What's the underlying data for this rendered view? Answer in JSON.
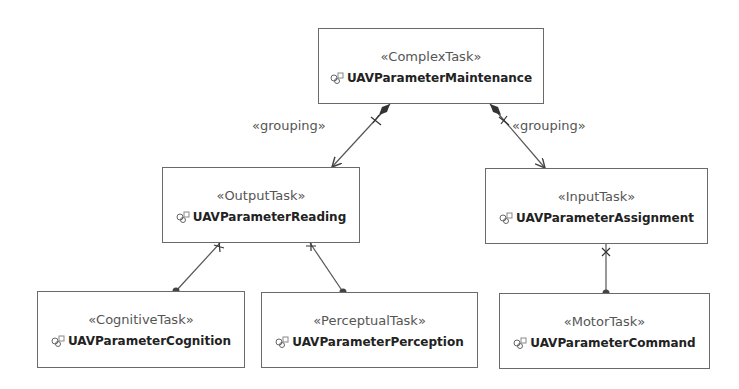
{
  "diagram": {
    "nodes": [
      {
        "id": "maintenance",
        "stereotype": "«ComplexTask»",
        "name": "UAVParameterMaintenance"
      },
      {
        "id": "reading",
        "stereotype": "«OutputTask»",
        "name": "UAVParameterReading"
      },
      {
        "id": "assignment",
        "stereotype": "«InputTask»",
        "name": "UAVParameterAssignment"
      },
      {
        "id": "cognition",
        "stereotype": "«CognitiveTask»",
        "name": "UAVParameterCognition"
      },
      {
        "id": "perception",
        "stereotype": "«PerceptualTask»",
        "name": "UAVParameterPerception"
      },
      {
        "id": "command",
        "stereotype": "«MotorTask»",
        "name": "UAVParameterCommand"
      }
    ],
    "edges": [
      {
        "from": "maintenance",
        "to": "reading",
        "label": "«grouping»"
      },
      {
        "from": "maintenance",
        "to": "assignment",
        "label": "«grouping»"
      },
      {
        "from": "reading",
        "to": "cognition",
        "label": ""
      },
      {
        "from": "reading",
        "to": "perception",
        "label": ""
      },
      {
        "from": "assignment",
        "to": "command",
        "label": ""
      }
    ],
    "node_icon": "task-component-icon",
    "colors": {
      "border": "#6a6a6a",
      "line": "#555555",
      "stereotype_text": "#555555",
      "name_text": "#222222"
    }
  }
}
